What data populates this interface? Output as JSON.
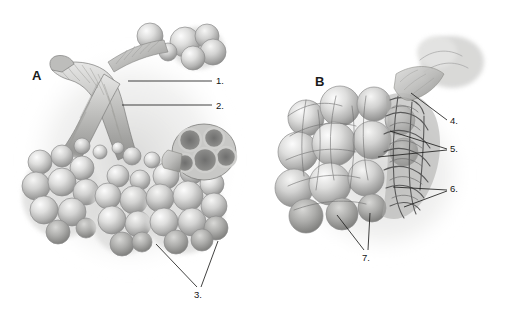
{
  "figure": {
    "type": "anatomical-illustration",
    "rendering": "grayscale pencil / airbrush medical illustration",
    "background_color": "#ffffff",
    "ink_color": "#20201f",
    "width_px": 508,
    "height_px": 328
  },
  "panels": [
    {
      "id": "A",
      "letter": "A",
      "letter_x": 32,
      "letter_y": 68,
      "description": "Terminal bronchiole branching into alveolar ducts, alveolar sacs and a cut-away cross-section of an alveolar sac cluster"
    },
    {
      "id": "B",
      "letter": "B",
      "letter_x": 315,
      "letter_y": 74,
      "description": "Cluster of alveoli shown with surrounding pulmonary capillary network, partly cut away"
    }
  ],
  "callouts": [
    {
      "number": "1.",
      "panel": "A",
      "label_x": 216,
      "label_y": 76,
      "leaders": [
        {
          "x1": 128,
          "y1": 81,
          "x2": 212,
          "y2": 81
        }
      ]
    },
    {
      "number": "2.",
      "panel": "A",
      "label_x": 216,
      "label_y": 101,
      "leaders": [
        {
          "x1": 122,
          "y1": 105,
          "x2": 212,
          "y2": 105
        }
      ]
    },
    {
      "number": "3.",
      "panel": "A",
      "label_x": 194,
      "label_y": 290,
      "leaders": [
        {
          "x1": 156,
          "y1": 244,
          "x2": 197,
          "y2": 287
        },
        {
          "x1": 218,
          "y1": 241,
          "x2": 201,
          "y2": 287
        }
      ]
    },
    {
      "number": "4.",
      "panel": "B",
      "label_x": 450,
      "label_y": 116,
      "leaders": [
        {
          "x1": 411,
          "y1": 93,
          "x2": 447,
          "y2": 120
        }
      ]
    },
    {
      "number": "5.",
      "panel": "B",
      "label_x": 450,
      "label_y": 144,
      "leaders": [
        {
          "x1": 390,
          "y1": 131,
          "x2": 447,
          "y2": 149
        },
        {
          "x1": 378,
          "y1": 157,
          "x2": 447,
          "y2": 150
        }
      ]
    },
    {
      "number": "6.",
      "panel": "B",
      "label_x": 450,
      "label_y": 184,
      "leaders": [
        {
          "x1": 393,
          "y1": 187,
          "x2": 447,
          "y2": 190
        },
        {
          "x1": 404,
          "y1": 207,
          "x2": 447,
          "y2": 191
        }
      ]
    },
    {
      "number": "7.",
      "panel": "B",
      "label_x": 362,
      "label_y": 253,
      "leaders": [
        {
          "x1": 337,
          "y1": 215,
          "x2": 364,
          "y2": 250
        },
        {
          "x1": 370,
          "y1": 213,
          "x2": 368,
          "y2": 250
        }
      ]
    }
  ]
}
